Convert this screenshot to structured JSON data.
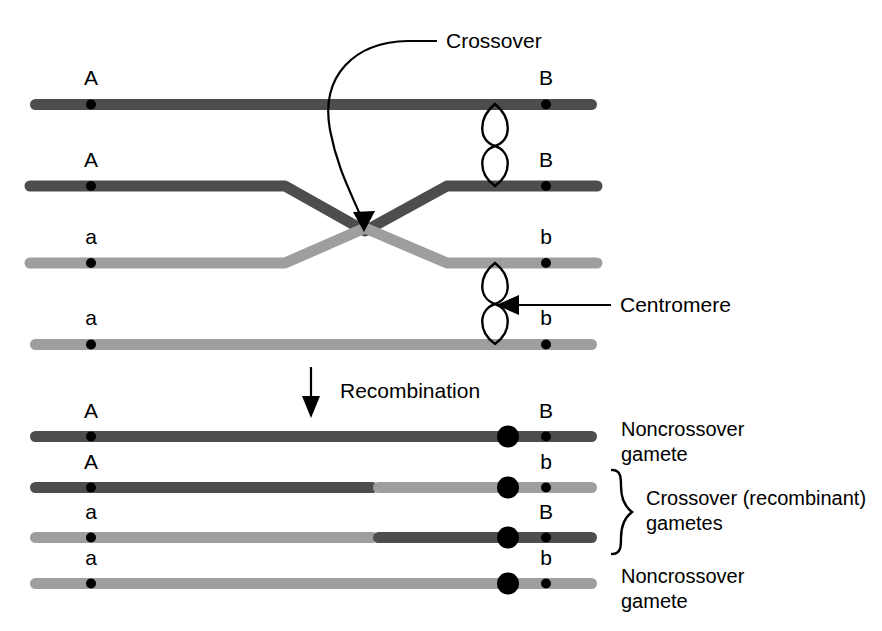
{
  "figure": {
    "width": 882,
    "height": 631,
    "background": "#ffffff"
  },
  "colors": {
    "dark_chromatid": "#4d4d4d",
    "light_chromatid": "#9e9e9e",
    "line": "#000000",
    "text": "#000000"
  },
  "callouts": {
    "crossover": "Crossover",
    "centromere": "Centromere",
    "recombination": "Recombination"
  },
  "alleles": {
    "A_upper": "A",
    "a_lower": "a",
    "B_upper": "B",
    "b_lower": "b"
  },
  "top_section": {
    "chromatids": [
      {
        "id": "chromatid-1",
        "left_allele": "A",
        "right_allele": "B",
        "shade": "dark",
        "crosses_over": false
      },
      {
        "id": "chromatid-2",
        "left_allele": "A",
        "right_allele": "B",
        "shade": "dark",
        "crosses_over": true
      },
      {
        "id": "chromatid-3",
        "left_allele": "a",
        "right_allele": "b",
        "shade": "light",
        "crosses_over": true
      },
      {
        "id": "chromatid-4",
        "left_allele": "a",
        "right_allele": "b",
        "shade": "light",
        "crosses_over": false
      }
    ],
    "centromere_count": 2
  },
  "bottom_section": {
    "gametes": [
      {
        "id": "gamete-1",
        "left_allele": "A",
        "right_allele": "B",
        "left_shade": "dark",
        "right_shade": "dark",
        "type_label": "Noncrossover gamete",
        "type_label_line1": "Noncrossover",
        "type_label_line2": "gamete",
        "recombinant": false
      },
      {
        "id": "gamete-2",
        "left_allele": "A",
        "right_allele": "b",
        "left_shade": "dark",
        "right_shade": "light",
        "type_label": "Crossover (recombinant) gametes",
        "recombinant": true
      },
      {
        "id": "gamete-3",
        "left_allele": "a",
        "right_allele": "B",
        "left_shade": "light",
        "right_shade": "dark",
        "type_label": "Crossover (recombinant) gametes",
        "recombinant": true
      },
      {
        "id": "gamete-4",
        "left_allele": "a",
        "right_allele": "b",
        "left_shade": "light",
        "right_shade": "light",
        "type_label_line1": "Noncrossover",
        "type_label_line2": "gamete",
        "recombinant": false
      }
    ],
    "bracket_label_line1": "Crossover (recombinant)",
    "bracket_label_line2": "gametes"
  }
}
